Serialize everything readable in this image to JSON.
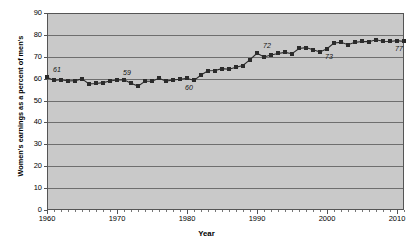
{
  "chart_data": {
    "type": "line",
    "title": "",
    "xlabel": "Year",
    "ylabel": "Women's earnings as a percent of men's",
    "xlim": [
      1960,
      2011
    ],
    "ylim": [
      0,
      90
    ],
    "yticks": [
      0,
      10,
      20,
      30,
      40,
      50,
      60,
      70,
      80,
      90
    ],
    "xticks": [
      1960,
      1970,
      1980,
      1990,
      2000,
      2010
    ],
    "grid": true,
    "legend": "none",
    "marker": "square",
    "series_color": "#2b2b2b",
    "plot_background": "#c9c9c9",
    "x": [
      1960,
      1961,
      1962,
      1963,
      1964,
      1965,
      1966,
      1967,
      1968,
      1969,
      1970,
      1971,
      1972,
      1973,
      1974,
      1975,
      1976,
      1977,
      1978,
      1979,
      1980,
      1981,
      1982,
      1983,
      1984,
      1985,
      1986,
      1987,
      1988,
      1989,
      1990,
      1991,
      1992,
      1993,
      1994,
      1995,
      1996,
      1997,
      1998,
      1999,
      2000,
      2001,
      2002,
      2003,
      2004,
      2005,
      2006,
      2007,
      2008,
      2009,
      2010,
      2011
    ],
    "values": [
      60.7,
      59.2,
      59.5,
      58.9,
      59.1,
      59.9,
      57.6,
      57.8,
      58.2,
      58.9,
      59.4,
      59.5,
      57.9,
      56.6,
      58.8,
      58.8,
      60.2,
      58.9,
      59.4,
      59.7,
      60.2,
      59.2,
      61.7,
      63.6,
      63.7,
      64.6,
      64.3,
      65.2,
      66.0,
      68.7,
      71.6,
      69.9,
      70.8,
      71.5,
      72.0,
      71.4,
      73.8,
      74.2,
      73.2,
      72.2,
      73.7,
      76.3,
      76.6,
      75.5,
      76.6,
      77.0,
      76.9,
      77.8,
      77.1,
      77.0,
      77.4,
      77.0
    ],
    "annotations": [
      {
        "label": "61",
        "x": 1961,
        "y": 60.7,
        "position": "above"
      },
      {
        "label": "59",
        "x": 1971,
        "y": 59.5,
        "position": "above"
      },
      {
        "label": "60",
        "x": 1981,
        "y": 59.2,
        "position": "below"
      },
      {
        "label": "72",
        "x": 1991,
        "y": 71.6,
        "position": "above"
      },
      {
        "label": "73",
        "x": 2001,
        "y": 73.7,
        "position": "below"
      },
      {
        "label": "77",
        "x": 2011,
        "y": 77.0,
        "position": "below"
      }
    ]
  }
}
